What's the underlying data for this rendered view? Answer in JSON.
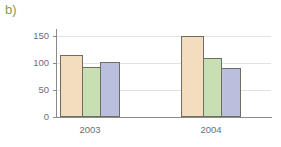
{
  "panel": {
    "label": "b)",
    "label_color": "#7f9b63"
  },
  "axes": {
    "y_tick_labels": [
      "150",
      "100",
      "50",
      "0"
    ],
    "x_tick_labels": [
      "2003",
      "2004"
    ]
  },
  "colors": {
    "series_1": "#f3ddbe",
    "series_2": "#c7dfb3",
    "series_3": "#b9bfdd",
    "bar_outline": "#6d6d63",
    "grid": "#e2e2e2",
    "axis": "#8a8a8a",
    "tick_text": "#6f6f6f"
  },
  "chart_data": {
    "type": "bar",
    "title": "",
    "subtitle": "b)",
    "xlabel": "",
    "ylabel": "",
    "categories": [
      "2003",
      "2004"
    ],
    "series": [
      {
        "name": "Series 1",
        "values": [
          115,
          150
        ]
      },
      {
        "name": "Series 2",
        "values": [
          92,
          110
        ]
      },
      {
        "name": "Series 3",
        "values": [
          101,
          91
        ]
      }
    ],
    "ylim": [
      0,
      162
    ],
    "yticks": [
      0,
      50,
      100,
      150
    ],
    "grid": "horizontal-only",
    "legend": "none",
    "bar_group_count": 2,
    "bars_per_group": 3
  }
}
